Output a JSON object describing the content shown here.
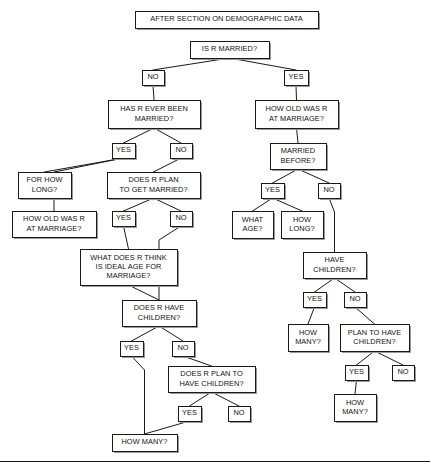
{
  "diagram": {
    "title": "AFTER SECTION ON DEMOGRAPHIC DATA",
    "type": "flowchart",
    "orientation": "top-down",
    "colors": {
      "background": "#ffffff",
      "box_fill": "#ffffff",
      "box_stroke": "#1a1a1a",
      "shadow": "#9a9a9a",
      "text": "#111111",
      "edge": "#1a1a1a"
    },
    "nodes": [
      {
        "id": "header",
        "kind": "header",
        "lines": [
          "AFTER SECTION ON DEMOGRAPHIC DATA"
        ],
        "x": 135,
        "y": 11,
        "w": 183,
        "h": 17
      },
      {
        "id": "q_is_married",
        "kind": "question",
        "lines": [
          "IS R MARRIED?"
        ],
        "x": 190,
        "y": 41,
        "w": 79,
        "h": 17
      },
      {
        "id": "a_married_no",
        "kind": "answer",
        "lines": [
          "NO"
        ],
        "x": 142,
        "y": 70,
        "w": 22,
        "h": 15
      },
      {
        "id": "a_married_yes",
        "kind": "answer",
        "lines": [
          "YES"
        ],
        "x": 284,
        "y": 70,
        "w": 24,
        "h": 15
      },
      {
        "id": "q_ever_married",
        "kind": "question",
        "lines": [
          "HAS R EVER BEEN",
          "MARRIED?"
        ],
        "x": 108,
        "y": 100,
        "w": 92,
        "h": 28
      },
      {
        "id": "q_age_at_marriage_r",
        "kind": "question",
        "lines": [
          "HOW OLD WAS R",
          "AT MARRIAGE?"
        ],
        "x": 255,
        "y": 100,
        "w": 83,
        "h": 28
      },
      {
        "id": "a_ever_yes",
        "kind": "answer",
        "lines": [
          "YES"
        ],
        "x": 112,
        "y": 143,
        "w": 23,
        "h": 15
      },
      {
        "id": "a_ever_no",
        "kind": "answer",
        "lines": [
          "NO"
        ],
        "x": 170,
        "y": 143,
        "w": 22,
        "h": 15
      },
      {
        "id": "q_married_before",
        "kind": "question",
        "lines": [
          "MARRIED",
          "BEFORE?"
        ],
        "x": 270,
        "y": 143,
        "w": 56,
        "h": 26
      },
      {
        "id": "q_for_how_long",
        "kind": "question",
        "lines": [
          "FOR HOW",
          "LONG?"
        ],
        "x": 18,
        "y": 172,
        "w": 53,
        "h": 26
      },
      {
        "id": "q_plan_get_married",
        "kind": "question",
        "lines": [
          "DOES R PLAN",
          "TO GET MARRIED?"
        ],
        "x": 107,
        "y": 172,
        "w": 93,
        "h": 26
      },
      {
        "id": "a_before_yes",
        "kind": "answer",
        "lines": [
          "YES"
        ],
        "x": 261,
        "y": 183,
        "w": 23,
        "h": 15
      },
      {
        "id": "a_before_no",
        "kind": "answer",
        "lines": [
          "NO"
        ],
        "x": 318,
        "y": 183,
        "w": 22,
        "h": 15
      },
      {
        "id": "q_how_old_marriage",
        "kind": "question",
        "lines": [
          "HOW OLD WAS R",
          "AT MARRIAGE?"
        ],
        "x": 12,
        "y": 211,
        "w": 84,
        "h": 26
      },
      {
        "id": "a_plan_yes",
        "kind": "answer",
        "lines": [
          "YES"
        ],
        "x": 112,
        "y": 211,
        "w": 23,
        "h": 15
      },
      {
        "id": "a_plan_no",
        "kind": "answer",
        "lines": [
          "NO"
        ],
        "x": 170,
        "y": 211,
        "w": 22,
        "h": 15
      },
      {
        "id": "q_what_age",
        "kind": "question",
        "lines": [
          "WHAT",
          "AGE?"
        ],
        "x": 232,
        "y": 211,
        "w": 41,
        "h": 27
      },
      {
        "id": "q_how_long",
        "kind": "question",
        "lines": [
          "HOW",
          "LONG?"
        ],
        "x": 281,
        "y": 211,
        "w": 42,
        "h": 27
      },
      {
        "id": "q_ideal_age",
        "kind": "question",
        "lines": [
          "WHAT DOES R THINK",
          "IS IDEAL AGE FOR",
          "MARRIAGE?"
        ],
        "x": 80,
        "y": 249,
        "w": 97,
        "h": 36
      },
      {
        "id": "q_have_children_r",
        "kind": "question",
        "lines": [
          "HAVE",
          "CHILDREN?"
        ],
        "x": 303,
        "y": 252,
        "w": 63,
        "h": 26
      },
      {
        "id": "a_have_yes",
        "kind": "answer",
        "lines": [
          "YES"
        ],
        "x": 303,
        "y": 292,
        "w": 23,
        "h": 15
      },
      {
        "id": "a_have_no",
        "kind": "answer",
        "lines": [
          "NO"
        ],
        "x": 344,
        "y": 292,
        "w": 22,
        "h": 15
      },
      {
        "id": "q_does_have_kids",
        "kind": "question",
        "lines": [
          "DOES R HAVE",
          "CHILDREN?"
        ],
        "x": 122,
        "y": 300,
        "w": 74,
        "h": 26
      },
      {
        "id": "a_kids_yes",
        "kind": "answer",
        "lines": [
          "YES"
        ],
        "x": 120,
        "y": 341,
        "w": 23,
        "h": 15
      },
      {
        "id": "a_kids_no",
        "kind": "answer",
        "lines": [
          "NO"
        ],
        "x": 172,
        "y": 341,
        "w": 22,
        "h": 15
      },
      {
        "id": "q_how_many_r1",
        "kind": "question",
        "lines": [
          "HOW",
          "MANY?"
        ],
        "x": 288,
        "y": 324,
        "w": 40,
        "h": 27
      },
      {
        "id": "q_plan_have_kids_r",
        "kind": "question",
        "lines": [
          "PLAN TO HAVE",
          "CHILDREN?"
        ],
        "x": 340,
        "y": 324,
        "w": 69,
        "h": 27
      },
      {
        "id": "q_does_plan_kids",
        "kind": "question",
        "lines": [
          "DOES R PLAN TO",
          "HAVE CHILDREN?"
        ],
        "x": 168,
        "y": 366,
        "w": 87,
        "h": 26
      },
      {
        "id": "a_planhave_yes",
        "kind": "answer",
        "lines": [
          "YES"
        ],
        "x": 345,
        "y": 365,
        "w": 23,
        "h": 15
      },
      {
        "id": "a_planhave_no",
        "kind": "answer",
        "lines": [
          "NO"
        ],
        "x": 392,
        "y": 365,
        "w": 22,
        "h": 15
      },
      {
        "id": "q_how_many_r2",
        "kind": "question",
        "lines": [
          "HOW",
          "MANY?"
        ],
        "x": 334,
        "y": 394,
        "w": 42,
        "h": 27
      },
      {
        "id": "a_doesplan_yes",
        "kind": "answer",
        "lines": [
          "YES"
        ],
        "x": 178,
        "y": 406,
        "w": 23,
        "h": 15
      },
      {
        "id": "a_doesplan_no",
        "kind": "answer",
        "lines": [
          "NO"
        ],
        "x": 228,
        "y": 406,
        "w": 22,
        "h": 15
      },
      {
        "id": "q_how_many_left",
        "kind": "question",
        "lines": [
          "HOW MANY?"
        ],
        "x": 112,
        "y": 434,
        "w": 65,
        "h": 17
      }
    ],
    "edges": [
      {
        "from": "q_is_married",
        "to": "a_married_no",
        "label": ""
      },
      {
        "from": "q_is_married",
        "to": "a_married_yes",
        "label": ""
      },
      {
        "from": "a_married_no",
        "to": "q_ever_married",
        "label": ""
      },
      {
        "from": "a_married_yes",
        "to": "q_age_at_marriage_r",
        "label": ""
      },
      {
        "from": "q_ever_married",
        "to": "a_ever_yes",
        "label": ""
      },
      {
        "from": "q_ever_married",
        "to": "a_ever_no",
        "label": ""
      },
      {
        "from": "a_ever_yes",
        "to": "q_for_how_long",
        "label": ""
      },
      {
        "from": "a_ever_yes",
        "to": "q_how_old_marriage",
        "label": ""
      },
      {
        "from": "a_ever_no",
        "to": "q_plan_get_married",
        "label": ""
      },
      {
        "from": "q_plan_get_married",
        "to": "a_plan_yes",
        "label": ""
      },
      {
        "from": "q_plan_get_married",
        "to": "a_plan_no",
        "label": ""
      },
      {
        "from": "a_plan_yes",
        "to": "q_ideal_age",
        "label": ""
      },
      {
        "from": "q_ideal_age",
        "to": "q_does_have_kids",
        "label": ""
      },
      {
        "from": "a_plan_no",
        "to": "q_does_have_kids",
        "label": ""
      },
      {
        "from": "q_does_have_kids",
        "to": "a_kids_yes",
        "label": ""
      },
      {
        "from": "q_does_have_kids",
        "to": "a_kids_no",
        "label": ""
      },
      {
        "from": "a_kids_yes",
        "to": "q_how_many_left",
        "label": ""
      },
      {
        "from": "a_kids_no",
        "to": "q_does_plan_kids",
        "label": ""
      },
      {
        "from": "q_does_plan_kids",
        "to": "a_doesplan_yes",
        "label": ""
      },
      {
        "from": "q_does_plan_kids",
        "to": "a_doesplan_no",
        "label": ""
      },
      {
        "from": "a_doesplan_yes",
        "to": "q_how_many_left",
        "label": ""
      },
      {
        "from": "q_age_at_marriage_r",
        "to": "q_married_before",
        "label": ""
      },
      {
        "from": "q_married_before",
        "to": "a_before_yes",
        "label": ""
      },
      {
        "from": "q_married_before",
        "to": "a_before_no",
        "label": ""
      },
      {
        "from": "a_before_yes",
        "to": "q_what_age",
        "label": ""
      },
      {
        "from": "a_before_yes",
        "to": "q_how_long",
        "label": ""
      },
      {
        "from": "a_before_no",
        "to": "q_have_children_r",
        "label": ""
      },
      {
        "from": "q_have_children_r",
        "to": "a_have_yes",
        "label": ""
      },
      {
        "from": "q_have_children_r",
        "to": "a_have_no",
        "label": ""
      },
      {
        "from": "a_have_yes",
        "to": "q_how_many_r1",
        "label": ""
      },
      {
        "from": "a_have_no",
        "to": "q_plan_have_kids_r",
        "label": ""
      },
      {
        "from": "q_plan_have_kids_r",
        "to": "a_planhave_yes",
        "label": ""
      },
      {
        "from": "q_plan_have_kids_r",
        "to": "a_planhave_no",
        "label": ""
      },
      {
        "from": "a_planhave_yes",
        "to": "q_how_many_r2",
        "label": ""
      }
    ]
  }
}
